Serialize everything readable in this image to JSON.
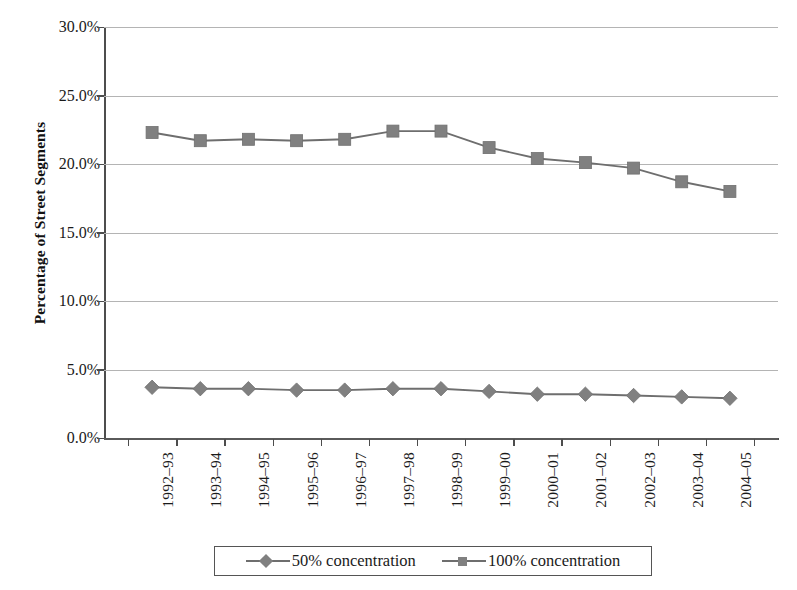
{
  "chart_data": {
    "type": "line",
    "title": "",
    "xlabel": "",
    "ylabel": "Percentage of Street Segments",
    "ylim": [
      0,
      30
    ],
    "ytick_labels": [
      "30.0%",
      "25.0%",
      "20.0%",
      "15.0%",
      "10.0%",
      "5.0%",
      "0.0%"
    ],
    "ytick_values": [
      30,
      25,
      20,
      15,
      10,
      5,
      0
    ],
    "grid": true,
    "legend_position": "bottom",
    "categories": [
      "1992–93",
      "1993–94",
      "1994–95",
      "1995–96",
      "1996–97",
      "1997–98",
      "1998–99",
      "1999–00",
      "2000–01",
      "2001–02",
      "2002–03",
      "2003–04",
      "2004–05"
    ],
    "series": [
      {
        "name": "50% concentration",
        "marker": "diamond",
        "color": "#808080",
        "line_color": "#6e6e6e",
        "values": [
          3.7,
          3.6,
          3.6,
          3.5,
          3.5,
          3.6,
          3.6,
          3.4,
          3.2,
          3.2,
          3.1,
          3.0,
          2.9
        ]
      },
      {
        "name": "100% concentration",
        "marker": "square",
        "color": "#808080",
        "line_color": "#6e6e6e",
        "values": [
          22.3,
          21.7,
          21.8,
          21.7,
          21.8,
          22.4,
          22.4,
          21.2,
          20.4,
          20.1,
          19.7,
          18.7,
          18.0
        ]
      }
    ]
  },
  "legend": {
    "items": [
      {
        "label": "50% concentration",
        "marker": "diamond"
      },
      {
        "label": "100% concentration",
        "marker": "square"
      }
    ]
  },
  "colors": {
    "series_gray": "#808080",
    "line_gray": "#6e6e6e",
    "gridline": "#b4b4b4",
    "axis": "#4d4d4d",
    "text": "#1a1a1a",
    "background": "#ffffff"
  }
}
